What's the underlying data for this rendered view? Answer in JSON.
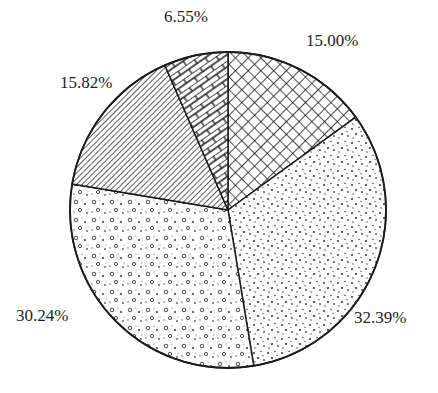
{
  "chart_data": {
    "type": "pie",
    "title": "",
    "start_angle_deg": 0,
    "direction": "clockwise",
    "slices": [
      {
        "label": "15.00%",
        "value": 15.0,
        "pattern": "crosshatch"
      },
      {
        "label": "32.39%",
        "value": 32.39,
        "pattern": "fine-dots"
      },
      {
        "label": "30.24%",
        "value": 30.24,
        "pattern": "circles-dots"
      },
      {
        "label": "15.82%",
        "value": 15.82,
        "pattern": "diagonal-lines"
      },
      {
        "label": "6.55%",
        "value": 6.55,
        "pattern": "brick"
      }
    ],
    "legend": []
  },
  "labels": {
    "s0": "15.00%",
    "s1": "32.39%",
    "s2": "30.24%",
    "s3": "15.82%",
    "s4": "6.55%"
  },
  "colors": {
    "stroke": "#1a1a1a",
    "background": "#ffffff"
  }
}
